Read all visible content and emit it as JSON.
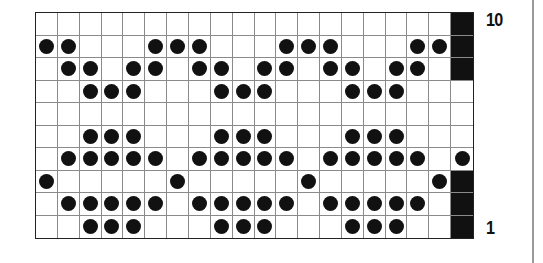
{
  "chart_data": {
    "type": "table",
    "columns": 20,
    "rows": 10,
    "row_labels": {
      "top": "10",
      "bottom": "1"
    },
    "legend": {
      "dot": "stitch marker",
      "black": "no stitch (shaded)"
    },
    "grid": [
      {
        "row": 10,
        "dots": [],
        "black": [
          19
        ]
      },
      {
        "row": 9,
        "dots": [
          0,
          1,
          5,
          6,
          7,
          11,
          12,
          13,
          17,
          18
        ],
        "black": [
          19
        ]
      },
      {
        "row": 8,
        "dots": [
          1,
          2,
          4,
          5,
          7,
          8,
          10,
          11,
          13,
          14,
          16,
          17
        ],
        "black": [
          19
        ]
      },
      {
        "row": 7,
        "dots": [
          2,
          3,
          4,
          8,
          9,
          10,
          14,
          15,
          16
        ],
        "black": []
      },
      {
        "row": 6,
        "dots": [],
        "black": []
      },
      {
        "row": 5,
        "dots": [
          2,
          3,
          4,
          8,
          9,
          10,
          14,
          15,
          16
        ],
        "black": []
      },
      {
        "row": 4,
        "dots": [
          1,
          2,
          3,
          4,
          5,
          7,
          8,
          9,
          10,
          11,
          13,
          14,
          15,
          16,
          17,
          19
        ],
        "black": []
      },
      {
        "row": 3,
        "dots": [
          0,
          6,
          12,
          18
        ],
        "black": [
          19
        ]
      },
      {
        "row": 2,
        "dots": [
          1,
          2,
          3,
          4,
          5,
          7,
          8,
          9,
          10,
          11,
          13,
          14,
          15,
          16,
          17
        ],
        "black": [
          19
        ]
      },
      {
        "row": 1,
        "dots": [
          2,
          3,
          4,
          8,
          9,
          10,
          14,
          15,
          16
        ],
        "black": [
          19
        ]
      }
    ]
  },
  "labels": {
    "top": "10",
    "bottom": "1"
  },
  "colors": {
    "ink": "#111111",
    "gridline": "#8a8a8a",
    "background": "#ffffff"
  }
}
